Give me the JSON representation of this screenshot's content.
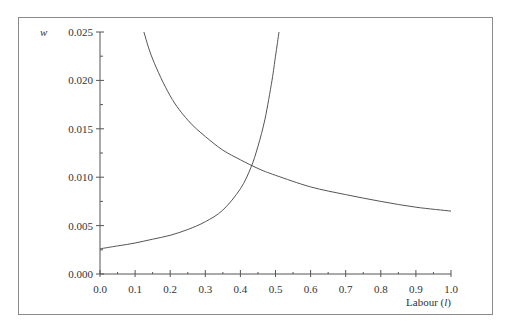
{
  "chart_data": {
    "type": "line",
    "title": "",
    "xlabel": "Labour (l)",
    "ylabel": "w",
    "xlim": [
      0.0,
      1.0
    ],
    "ylim": [
      0.0,
      0.025
    ],
    "x_ticks": [
      "0.0",
      "0.1",
      "0.2",
      "0.3",
      "0.4",
      "0.5",
      "0.6",
      "0.7",
      "0.8",
      "0.9",
      "1.0"
    ],
    "y_ticks": [
      "0.000",
      "0.005",
      "0.010",
      "0.015",
      "0.020",
      "0.025"
    ],
    "grid": false,
    "legend": null,
    "series": [
      {
        "name": "rising curve",
        "x": [
          0.0,
          0.05,
          0.1,
          0.15,
          0.2,
          0.25,
          0.3,
          0.35,
          0.4,
          0.43,
          0.45,
          0.47,
          0.49,
          0.5,
          0.51
        ],
        "y": [
          0.0026,
          0.0029,
          0.0032,
          0.0036,
          0.004,
          0.0046,
          0.0054,
          0.0066,
          0.0088,
          0.011,
          0.0132,
          0.016,
          0.02,
          0.0225,
          0.025
        ]
      },
      {
        "name": "falling curve",
        "x": [
          0.125,
          0.15,
          0.2,
          0.25,
          0.3,
          0.35,
          0.4,
          0.45,
          0.5,
          0.6,
          0.7,
          0.8,
          0.9,
          1.0
        ],
        "y": [
          0.025,
          0.0222,
          0.0184,
          0.0159,
          0.0142,
          0.0128,
          0.0118,
          0.0109,
          0.0102,
          0.009,
          0.0082,
          0.0075,
          0.0069,
          0.0065
        ]
      }
    ],
    "annotations": []
  }
}
